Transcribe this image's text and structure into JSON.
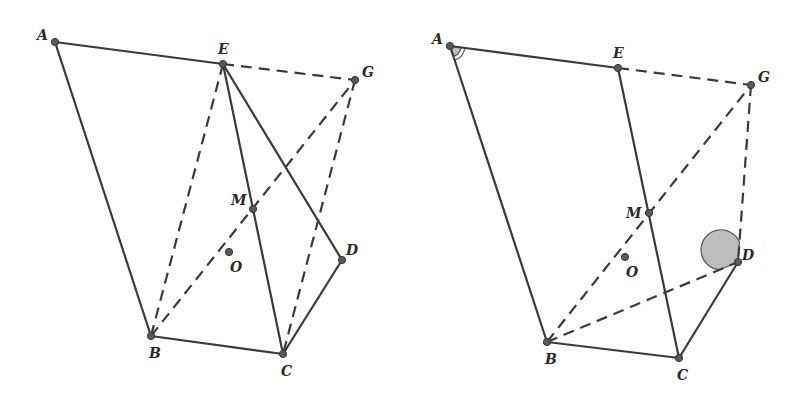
{
  "figures": [
    {
      "id": "left",
      "points": {
        "A": {
          "label": "A",
          "x": 55,
          "y": 42,
          "lx": 37,
          "ly": 40
        },
        "E": {
          "label": "E",
          "x": 223,
          "y": 64,
          "lx": 218,
          "ly": 54
        },
        "G": {
          "label": "G",
          "x": 355,
          "y": 80,
          "lx": 362,
          "ly": 77
        },
        "M": {
          "label": "M",
          "x": 253,
          "y": 209,
          "lx": 231,
          "ly": 205
        },
        "O": {
          "label": "O",
          "x": 229,
          "y": 252,
          "lx": 230,
          "ly": 272
        },
        "D": {
          "label": "D",
          "x": 342,
          "y": 260,
          "lx": 346,
          "ly": 255
        },
        "B": {
          "label": "B",
          "x": 151,
          "y": 336,
          "lx": 149,
          "ly": 358
        },
        "C": {
          "label": "C",
          "x": 283,
          "y": 354,
          "lx": 281,
          "ly": 376
        }
      },
      "solid_segments": [
        [
          "A",
          "E"
        ],
        [
          "A",
          "B"
        ],
        [
          "B",
          "C"
        ],
        [
          "C",
          "D"
        ],
        [
          "D",
          "E"
        ],
        [
          "E",
          "C"
        ]
      ],
      "dashed_segments": [
        [
          "E",
          "G"
        ],
        [
          "E",
          "B"
        ],
        [
          "B",
          "G"
        ],
        [
          "G",
          "C"
        ]
      ],
      "angle_marks": []
    },
    {
      "id": "right",
      "points": {
        "A": {
          "label": "A",
          "x": 450,
          "y": 46,
          "lx": 432,
          "ly": 44
        },
        "E": {
          "label": "E",
          "x": 618,
          "y": 68,
          "lx": 613,
          "ly": 58
        },
        "G": {
          "label": "G",
          "x": 751,
          "y": 85,
          "lx": 758,
          "ly": 82
        },
        "M": {
          "label": "M",
          "x": 649,
          "y": 213,
          "lx": 626,
          "ly": 218
        },
        "O": {
          "label": "O",
          "x": 625,
          "y": 257,
          "lx": 626,
          "ly": 277
        },
        "D": {
          "label": "D",
          "x": 738,
          "y": 262,
          "lx": 742,
          "ly": 260
        },
        "B": {
          "label": "B",
          "x": 547,
          "y": 342,
          "lx": 545,
          "ly": 364
        },
        "C": {
          "label": "C",
          "x": 679,
          "y": 358,
          "lx": 677,
          "ly": 380
        }
      },
      "solid_segments": [
        [
          "A",
          "E"
        ],
        [
          "A",
          "B"
        ],
        [
          "B",
          "C"
        ],
        [
          "C",
          "D"
        ],
        [
          "E",
          "C"
        ]
      ],
      "dashed_segments": [
        [
          "E",
          "G"
        ],
        [
          "B",
          "G"
        ],
        [
          "G",
          "D"
        ],
        [
          "B",
          "D"
        ]
      ],
      "angle_marks": [
        {
          "vertex": "A",
          "style": "double-arc",
          "from": "E",
          "to": "B"
        },
        {
          "vertex": "D",
          "style": "filled-sector",
          "from": "G",
          "to": "B"
        }
      ]
    }
  ]
}
